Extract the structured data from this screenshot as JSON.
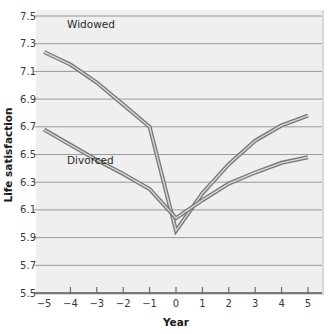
{
  "chart_data": {
    "type": "line",
    "title": "",
    "xlabel": "Year",
    "ylabel": "Life satisfaction",
    "x": [
      -5,
      -4,
      -3,
      -2,
      -1,
      0,
      1,
      2,
      3,
      4,
      5
    ],
    "x_tick_labels": [
      "−5",
      "−4",
      "−3",
      "−2",
      "−1",
      "0",
      "1",
      "2",
      "3",
      "4",
      "5"
    ],
    "y_ticks": [
      5.5,
      5.7,
      5.9,
      6.1,
      6.3,
      6.5,
      6.7,
      6.9,
      7.1,
      7.3,
      7.5
    ],
    "y_tick_labels": [
      "5.5",
      "5.7",
      "5.9",
      "6.1",
      "6.3",
      "6.5",
      "6.7",
      "6.9",
      "7.1",
      "7.3",
      "7.5"
    ],
    "ylim": [
      5.5,
      7.5
    ],
    "xlim": [
      -5,
      5
    ],
    "grid": "horizontal",
    "legend": "inline labels near series start",
    "series": [
      {
        "name": "Widowed",
        "values": [
          7.24,
          7.15,
          7.02,
          6.86,
          6.7,
          5.95,
          6.22,
          6.43,
          6.6,
          6.71,
          6.78
        ]
      },
      {
        "name": "Divorced",
        "values": [
          6.68,
          6.57,
          6.46,
          6.36,
          6.25,
          6.04,
          6.17,
          6.29,
          6.37,
          6.44,
          6.48
        ]
      }
    ]
  },
  "colors": {
    "plot_background": "#efefef",
    "gridline": "#9a9a9a",
    "series_outline": "#777777",
    "series_fill": "#d8d8d8",
    "axis": "#555555"
  }
}
